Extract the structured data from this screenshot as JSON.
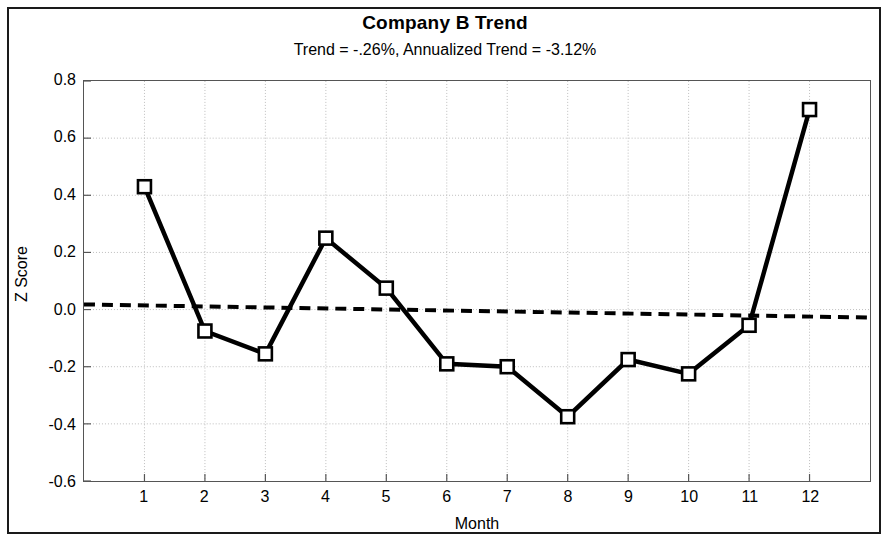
{
  "chart_data": {
    "type": "line",
    "title": "Company B Trend",
    "subtitle": "Trend = -.26%,  Annualized Trend = -3.12%",
    "xlabel": "Month",
    "ylabel": "Z Score",
    "x": [
      1,
      2,
      3,
      4,
      5,
      6,
      7,
      8,
      9,
      10,
      11,
      12
    ],
    "categories": [
      "1",
      "2",
      "3",
      "4",
      "5",
      "6",
      "7",
      "8",
      "9",
      "10",
      "11",
      "12"
    ],
    "series": [
      {
        "name": "Z Score",
        "marker": "open-square",
        "line_style": "solid",
        "color": "#000000",
        "values": [
          0.43,
          -0.075,
          -0.155,
          0.25,
          0.075,
          -0.19,
          -0.2,
          -0.375,
          -0.175,
          -0.225,
          -0.055,
          0.7
        ]
      },
      {
        "name": "Trend line",
        "marker": "none",
        "line_style": "dashed",
        "color": "#000000",
        "endpoints": [
          0.018,
          -0.028
        ]
      }
    ],
    "xlim": [
      0,
      13
    ],
    "ylim": [
      -0.6,
      0.8
    ],
    "ytick_labels": [
      "0.8",
      "0.6",
      "0.4",
      "0.2",
      "0.0",
      "-0.2",
      "-0.4",
      "-0.6"
    ],
    "ytick_values": [
      0.8,
      0.6,
      0.4,
      0.2,
      0.0,
      -0.2,
      -0.4,
      -0.6
    ],
    "xtick_values": [
      1,
      2,
      3,
      4,
      5,
      6,
      7,
      8,
      9,
      10,
      11,
      12
    ],
    "grid": true,
    "grid_style": "dotted",
    "grid_color": "#bdbdbd",
    "legend": "none",
    "plot_background": "#ffffff",
    "frame_color": "#555555"
  }
}
